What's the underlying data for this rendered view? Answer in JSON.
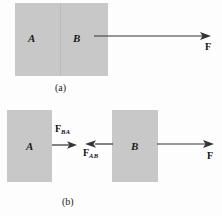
{
  "figure": {
    "background_color": "#fdfdfd",
    "block_color": "#c8c8c8",
    "line_color": "#333333"
  },
  "panel_a": {
    "caption": "(a)",
    "block_a_letter": "A",
    "block_b_letter": "B",
    "applied_force_label": "F"
  },
  "panel_b": {
    "caption": "(b)",
    "block_a_letter": "A",
    "block_b_letter": "B",
    "force_ba_label": "F",
    "force_ba_sub": "BA",
    "force_ab_label": "F",
    "force_ab_sub": "AB",
    "applied_force_label": "F"
  }
}
